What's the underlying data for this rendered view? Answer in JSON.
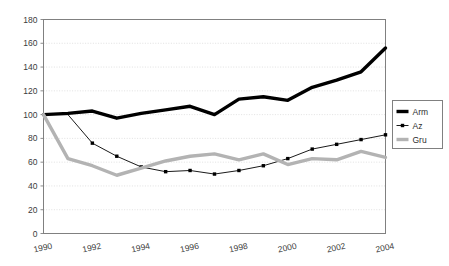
{
  "chart_data": {
    "type": "line",
    "title": "",
    "xlabel": "",
    "ylabel": "",
    "xlim": [
      1990,
      2004
    ],
    "ylim": [
      0,
      180
    ],
    "ytick_step": 20,
    "xtick_step": 2,
    "grid": true,
    "grid_axis": "y",
    "legend_position": "right",
    "x": [
      1990,
      1991,
      1992,
      1993,
      1994,
      1995,
      1996,
      1997,
      1998,
      1999,
      2000,
      2001,
      2002,
      2003,
      2004
    ],
    "xticklabels": [
      "1990",
      "1992",
      "1994",
      "1996",
      "1998",
      "2000",
      "2002",
      "2004"
    ],
    "yticklabels": [
      "0",
      "20",
      "40",
      "60",
      "80",
      "100",
      "120",
      "140",
      "160",
      "180"
    ],
    "series": [
      {
        "name": "Arm",
        "color": "#000000",
        "linewidth": 3.4,
        "marker": "none",
        "values": [
          100,
          101,
          103,
          97,
          101,
          104,
          107,
          100,
          113,
          115,
          112,
          123,
          129,
          136,
          156
        ]
      },
      {
        "name": "Az",
        "color": "#000000",
        "linewidth": 0.9,
        "marker": "square",
        "values": [
          100,
          100,
          76,
          65,
          56,
          52,
          53,
          50,
          53,
          57,
          63,
          71,
          75,
          79,
          83
        ]
      },
      {
        "name": "Gru",
        "color": "#b3b3b3",
        "linewidth": 3.4,
        "marker": "none",
        "values": [
          100,
          63,
          57,
          49,
          55,
          61,
          65,
          67,
          62,
          67,
          58,
          63,
          62,
          69,
          64
        ]
      }
    ]
  },
  "legend": {
    "items": [
      {
        "label": "Arm",
        "swatch": "thick-black-line"
      },
      {
        "label": "Az",
        "swatch": "thin-black-line-with-square-marker"
      },
      {
        "label": "Gru",
        "swatch": "thick-gray-line"
      }
    ]
  },
  "colors": {
    "axis": "#808080",
    "grid": "#d9d9d9",
    "arm": "#000000",
    "az": "#000000",
    "gru": "#b3b3b3",
    "text": "#3b3b3b",
    "background": "#ffffff"
  }
}
